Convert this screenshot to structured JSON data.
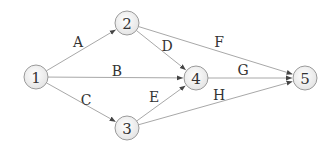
{
  "diagram": {
    "type": "network-graph",
    "nodes": [
      {
        "id": "1",
        "label": "1",
        "x": 36,
        "y": 77
      },
      {
        "id": "2",
        "label": "2",
        "x": 127,
        "y": 23
      },
      {
        "id": "3",
        "label": "3",
        "x": 127,
        "y": 128
      },
      {
        "id": "4",
        "label": "4",
        "x": 196,
        "y": 78
      },
      {
        "id": "5",
        "label": "5",
        "x": 305,
        "y": 78
      }
    ],
    "edges": [
      {
        "id": "A",
        "label": "A",
        "from": "1",
        "to": "2",
        "lx": 78,
        "ly": 42
      },
      {
        "id": "B",
        "label": "B",
        "from": "1",
        "to": "4",
        "lx": 117,
        "ly": 71
      },
      {
        "id": "C",
        "label": "C",
        "from": "1",
        "to": "3",
        "lx": 86,
        "ly": 100
      },
      {
        "id": "D",
        "label": "D",
        "from": "2",
        "to": "4",
        "lx": 167,
        "ly": 46
      },
      {
        "id": "E",
        "label": "E",
        "from": "3",
        "to": "4",
        "lx": 154,
        "ly": 97
      },
      {
        "id": "F",
        "label": "F",
        "from": "2",
        "to": "5",
        "lx": 219,
        "ly": 42
      },
      {
        "id": "G",
        "label": "G",
        "from": "4",
        "to": "5",
        "lx": 243,
        "ly": 70
      },
      {
        "id": "H",
        "label": "H",
        "from": "3",
        "to": "5",
        "lx": 219,
        "ly": 95
      }
    ],
    "colors": {
      "edge": "#a8a8a8",
      "node_border": "#9a9a9a",
      "node_fill_center": "#ffffff",
      "node_fill_edge": "#e4e4e4",
      "text": "#333333"
    }
  }
}
